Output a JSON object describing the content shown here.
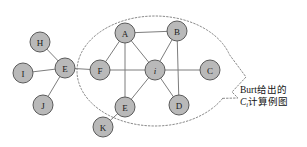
{
  "figure": {
    "width": 307,
    "height": 147,
    "background": "#ffffff",
    "node_fill": "#b9b9b9",
    "node_stroke": "#5a5a5a",
    "edge_color": "#7d7d7d",
    "hull_color": "#8a8a8a"
  },
  "nodes": [
    {
      "id": "H",
      "label": "H",
      "x": 40,
      "y": 42,
      "r": 10,
      "italic": false,
      "in_cluster": false
    },
    {
      "id": "I",
      "label": "I",
      "x": 23,
      "y": 73,
      "r": 10,
      "italic": false,
      "in_cluster": false
    },
    {
      "id": "J",
      "label": "J",
      "x": 43,
      "y": 105,
      "r": 10,
      "italic": false,
      "in_cluster": false
    },
    {
      "id": "El",
      "label": "E",
      "x": 65,
      "y": 68,
      "r": 10,
      "italic": false,
      "in_cluster": false
    },
    {
      "id": "F",
      "label": "F",
      "x": 100,
      "y": 70,
      "r": 10,
      "italic": false,
      "in_cluster": true
    },
    {
      "id": "A",
      "label": "A",
      "x": 125,
      "y": 33,
      "r": 10,
      "italic": false,
      "in_cluster": true
    },
    {
      "id": "B",
      "label": "B",
      "x": 177,
      "y": 31,
      "r": 10,
      "italic": false,
      "in_cluster": true
    },
    {
      "id": "i",
      "label": "i",
      "x": 155,
      "y": 70,
      "r": 10,
      "italic": true,
      "in_cluster": true
    },
    {
      "id": "C",
      "label": "C",
      "x": 210,
      "y": 70,
      "r": 10,
      "italic": false,
      "in_cluster": true
    },
    {
      "id": "Eb",
      "label": "E",
      "x": 125,
      "y": 107,
      "r": 10,
      "italic": false,
      "in_cluster": true
    },
    {
      "id": "D",
      "label": "D",
      "x": 179,
      "y": 105,
      "r": 10,
      "italic": false,
      "in_cluster": true
    },
    {
      "id": "K",
      "label": "K",
      "x": 103,
      "y": 127,
      "r": 10,
      "italic": false,
      "in_cluster": false
    }
  ],
  "edges": [
    {
      "from": "H",
      "to": "El"
    },
    {
      "from": "I",
      "to": "El"
    },
    {
      "from": "J",
      "to": "El"
    },
    {
      "from": "El",
      "to": "F"
    },
    {
      "from": "F",
      "to": "A"
    },
    {
      "from": "F",
      "to": "i"
    },
    {
      "from": "A",
      "to": "B"
    },
    {
      "from": "A",
      "to": "i"
    },
    {
      "from": "A",
      "to": "Eb"
    },
    {
      "from": "B",
      "to": "i"
    },
    {
      "from": "B",
      "to": "D"
    },
    {
      "from": "i",
      "to": "C"
    },
    {
      "from": "i",
      "to": "Eb"
    },
    {
      "from": "i",
      "to": "D"
    },
    {
      "from": "Eb",
      "to": "K"
    }
  ],
  "cluster": {
    "label": "ego-network-outline",
    "cx": 155,
    "cy": 71,
    "rx": 78,
    "ry": 55
  },
  "callout": {
    "line1": "Burt给出的",
    "line2_prefix": "C",
    "line2_sub": "i",
    "line2_suffix": "计算例图"
  }
}
